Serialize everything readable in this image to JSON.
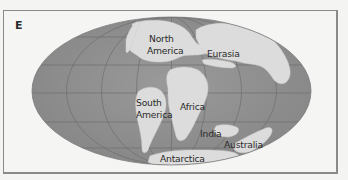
{
  "figure": {
    "panel_label": "E",
    "projection": "Mollweide-style elliptical world map",
    "colors": {
      "ocean": "#8f8f8f",
      "ocean_edge": "#7a7a7a",
      "land": "#dcdcdc",
      "graticule": "#6e6e6e",
      "frame": "#8a8a8a",
      "background": "#f5f5f4"
    },
    "continent_labels": {
      "north_america_line1": "North",
      "north_america_line2": "America",
      "eurasia": "Eurasia",
      "south_america_line1": "South",
      "south_america_line2": "America",
      "africa": "Africa",
      "india": "India",
      "australia": "Australia",
      "antarctica": "Antarctica"
    }
  }
}
